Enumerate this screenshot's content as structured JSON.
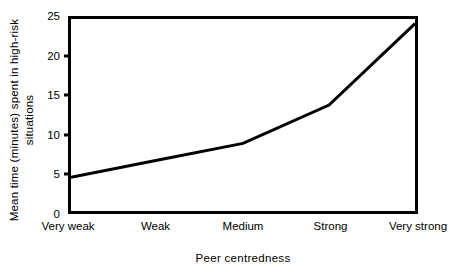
{
  "chart_data": {
    "type": "line",
    "title": "",
    "xlabel": "Peer centredness",
    "ylabel": "Mean time (minutes) spent in high-risk",
    "ylabel_line2": "situations",
    "categories": [
      "Very weak",
      "Weak",
      "Medium",
      "Strong",
      "Very strong"
    ],
    "values": [
      4.4,
      6.6,
      8.8,
      13.8,
      24.4
    ],
    "ylim": [
      0,
      25
    ],
    "yticks": [
      0,
      5,
      10,
      15,
      20,
      25
    ],
    "ytick_labels": [
      "0",
      "5",
      "10",
      "15",
      "20",
      "25"
    ],
    "grid": false,
    "legend": false,
    "series_color": "#000000",
    "frame_color": "#000000",
    "background_color": "#ffffff"
  }
}
